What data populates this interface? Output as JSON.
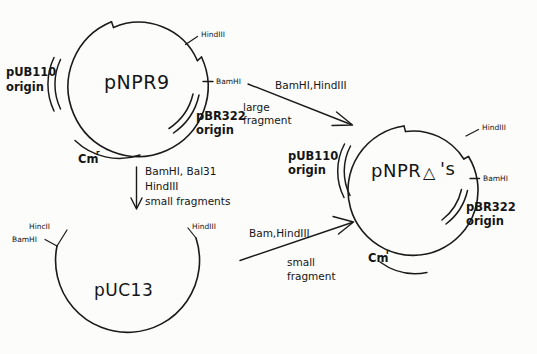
{
  "figure": {
    "background_color": "#fcfcfb",
    "ink_color": "#1a1a1a"
  },
  "plasmids": [
    {
      "id": "pnpr9",
      "name": "pNPR9",
      "position": "top-left",
      "sites": [
        {
          "name": "HindIII"
        },
        {
          "name": "BamHI"
        }
      ],
      "regions": [
        {
          "name": "pUB110 origin",
          "line1": "pUB110",
          "line2": "origin"
        },
        {
          "name": "pBR322 origin",
          "line1": "pBR322",
          "line2": "origin"
        },
        {
          "name": "Cm resistance",
          "base": "Cm",
          "superscript": "r"
        }
      ]
    },
    {
      "id": "pnpr-deltas",
      "name_part1": "pNPR",
      "name_delta": "△",
      "name_part2": "'s",
      "name_full": "pNPR △ 's",
      "position": "right",
      "sites": [
        {
          "name": "HindIII"
        },
        {
          "name": "BamHI"
        }
      ],
      "regions": [
        {
          "name": "pUB110 origin",
          "line1": "pUB110",
          "line2": "origin"
        },
        {
          "name": "pBR322 origin",
          "line1": "pBR322",
          "line2": "origin"
        },
        {
          "name": "Cm resistance",
          "base": "Cm",
          "superscript": "r"
        }
      ]
    },
    {
      "id": "puc13",
      "name": "pUC13",
      "position": "bottom-left",
      "sites": [
        {
          "name": "HincII"
        },
        {
          "name": "BamHI"
        },
        {
          "name": "HindIII"
        }
      ],
      "regions": []
    }
  ],
  "arrows": [
    {
      "id": "arrow-upper-right",
      "direction": "down-right",
      "label_above": "BamHI,HindIII",
      "label_below_line1": "large",
      "label_below_line2": "fragment"
    },
    {
      "id": "arrow-down",
      "direction": "down",
      "label_line1": "BamHI, Bal31",
      "label_line2": "HindIII",
      "label_line3": "small fragments"
    },
    {
      "id": "arrow-lower-right",
      "direction": "up-right",
      "label_above": "Bam,HindIII",
      "label_below_line1": "small",
      "label_below_line2": "fragment"
    }
  ]
}
